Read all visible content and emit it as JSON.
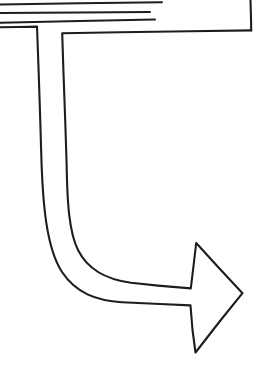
{
  "canvas": {
    "width": 265,
    "height": 381,
    "background_color": "#ffffff",
    "ink_color": "#1d1d1f",
    "style": "hand-drawn line art"
  },
  "figure": {
    "name": "curved-u-turn-arrow",
    "stroke_color": "#1d1d1f",
    "fill_color": "#ffffff",
    "stroke_width": 2.1
  },
  "elements": {
    "top_rules": {
      "name": "top-horizontal-rules",
      "count": 3,
      "color": "#1d1d1f",
      "lines": [
        {
          "x1": 0,
          "y1": 4,
          "x2": 162,
          "y2": 2
        },
        {
          "x1": 0,
          "y1": 12,
          "x2": 150,
          "y2": 12
        },
        {
          "x1": 0,
          "y1": 22,
          "x2": 155,
          "y2": 19
        }
      ]
    },
    "outer_edge": {
      "name": "arrow-outer-edge",
      "path": "M 0,27 L 37,27 L 62,33 L 251,30 L 251,0"
    },
    "arrow_outline": {
      "name": "arrow-outline-path",
      "path": "M 0,27 L 37,27 L 41,150 C 45,235 62,283 120,300 L 190,305 L 196,352 L 242,293 L 196,243 L 190,288 L 130,282 C 88,270 70,238 67,160 L 62,33 L 251,30"
    },
    "arrowhead": {
      "name": "arrowhead",
      "tip": {
        "x": 242,
        "y": 293
      },
      "upper_barb": {
        "x": 196,
        "y": 243
      },
      "lower_barb": {
        "x": 195,
        "y": 352
      },
      "upper_notch": {
        "x": 190,
        "y": 288
      },
      "lower_notch": {
        "x": 190,
        "y": 305
      },
      "direction": "right"
    },
    "shaft": {
      "name": "arrow-shaft",
      "inner_curve": "M 67,160 C 70,238 88,270 130,282 L 190,288",
      "outer_curve": "M 41,150 C 45,235 62,283 120,300 L 190,305",
      "width_px": 26,
      "bend": "u-turn-clockwise"
    },
    "corner_bracket": {
      "name": "corner-bracket",
      "vertical_x": 251,
      "vertical_from_y": 0,
      "vertical_to_y": 30,
      "horizontal_y": 31
    }
  },
  "labels": {
    "title": "",
    "caption": "",
    "annotations": []
  }
}
